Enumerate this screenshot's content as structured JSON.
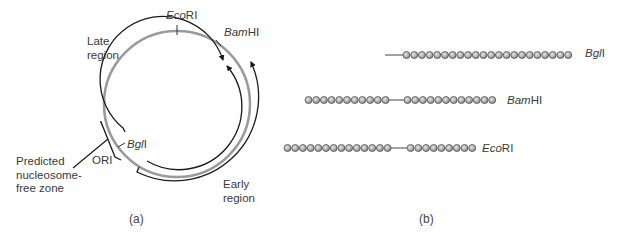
{
  "panel_a": {
    "label": "(a)",
    "sites": {
      "ecori": {
        "italic": "Eco",
        "roman": "RI"
      },
      "bamhi": {
        "italic": "Bam",
        "roman": "HI"
      },
      "bgli": {
        "italic": "Bgl",
        "roman": "I"
      }
    },
    "regions": {
      "late_line1": "Late",
      "late_line2": "region",
      "early_line1": "Early",
      "early_line2": "region",
      "ori": "ORI"
    },
    "nfz": {
      "line1": "Predicted",
      "line2": "nucleosome-",
      "line3": "free zone"
    },
    "colors": {
      "ring": "#9a9a9a",
      "arcs": "#1a1a1a"
    }
  },
  "panel_b": {
    "label": "(b)",
    "rows": [
      {
        "enzyme": {
          "italic": "Bgl",
          "roman": "I"
        },
        "left_beads": 0,
        "gap": true,
        "right_beads": 22
      },
      {
        "enzyme": {
          "italic": "Bam",
          "roman": "HI"
        },
        "left_beads": 11,
        "gap": true,
        "right_beads": 12
      },
      {
        "enzyme": {
          "italic": "Eco",
          "roman": "RI"
        },
        "left_beads": 14,
        "gap": true,
        "right_beads": 9
      }
    ],
    "colors": {
      "bead_fill": "#bdbdbd",
      "bead_edge": "#555555",
      "linker": "#444444"
    }
  }
}
